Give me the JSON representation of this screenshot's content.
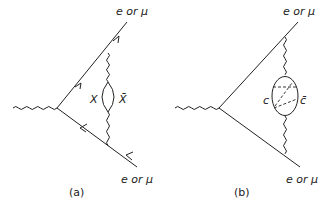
{
  "diagrams": [
    {
      "id": "a",
      "caption": "(a)",
      "external_top_label": "e or μ",
      "external_bottom_label": "e or μ",
      "loop_left_label": "X",
      "loop_right_label": "X̄",
      "incoming": "photon (wavy line)",
      "loop_type": "X X-bar pair loop",
      "fermion_arrows": true
    },
    {
      "id": "b",
      "caption": "(b)",
      "external_top_label": "e or μ",
      "external_bottom_label": "e or μ",
      "loop_left_label": "c",
      "loop_right_label": "c̄",
      "incoming": "photon (wavy line)",
      "loop_type": "c c-bar loop with dashed internal lines",
      "fermion_arrows": false
    }
  ]
}
